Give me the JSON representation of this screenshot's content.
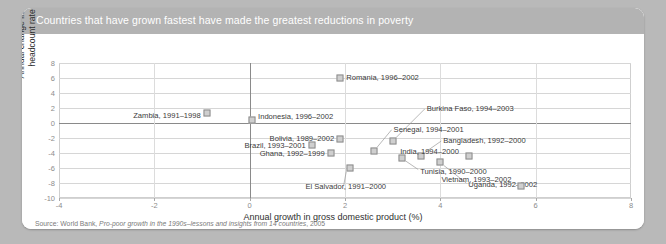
{
  "figure": {
    "title": "Countries that have grown fastest have made the greatest reductions in poverty",
    "source_prefix": "Source: World Bank, ",
    "source_italic": "Pro-poor growth in the 1990s–lessons and insights from 14 countries",
    "source_suffix": ", 2005",
    "header_color": "#b3b3b3",
    "marker_fill": "#cfcfcf",
    "marker_stroke": "#8d8d8d",
    "page_background": "#b9b9b9"
  },
  "chart_data": {
    "type": "scatter",
    "title": "Countries that have grown fastest have made the greatest reductions in poverty",
    "xlabel": "Annual growth in gross domestic product (%)",
    "ylabel": "Annual change in poverty headcount rate (%)",
    "xlim": [
      -4,
      8
    ],
    "ylim": [
      -10,
      8
    ],
    "xticks": [
      -4,
      -2,
      0,
      2,
      4,
      6,
      8
    ],
    "yticks": [
      8,
      6,
      4,
      2,
      0,
      -2,
      -4,
      -6,
      -8,
      -10
    ],
    "grid": true,
    "legend": "none",
    "points": [
      {
        "label": "Romania, 1996–2002",
        "x": 1.9,
        "y": 6.0
      },
      {
        "label": "Zambia, 1991–1998",
        "x": -0.9,
        "y": 1.3
      },
      {
        "label": "Indonesia, 1996–2002",
        "x": 0.05,
        "y": 0.4
      },
      {
        "label": "Bolivia, 1989–2002",
        "x": 1.9,
        "y": -2.1
      },
      {
        "label": "Brazil, 1993–2001",
        "x": 1.3,
        "y": -2.9
      },
      {
        "label": "Ghana, 1992–1999",
        "x": 1.7,
        "y": -4.0
      },
      {
        "label": "Burkina Faso, 1994–2003",
        "x": 3.0,
        "y": -2.4
      },
      {
        "label": "Senegal, 1994–2001",
        "x": 2.6,
        "y": -3.7
      },
      {
        "label": "Bangladesh, 1992–2000",
        "x": 3.6,
        "y": -4.4
      },
      {
        "label": "India, 1994–2000",
        "x": 4.6,
        "y": -4.4
      },
      {
        "label": "Tunisia, 1990–2000",
        "x": 3.2,
        "y": -4.6
      },
      {
        "label": "Uganda, 1992–2002",
        "x": 4.0,
        "y": -5.2
      },
      {
        "label": "El Salvador, 1991–2000",
        "x": 2.1,
        "y": -6.0
      },
      {
        "label": "Vietnam, 1993–2002",
        "x": 5.7,
        "y": -8.4
      }
    ]
  }
}
